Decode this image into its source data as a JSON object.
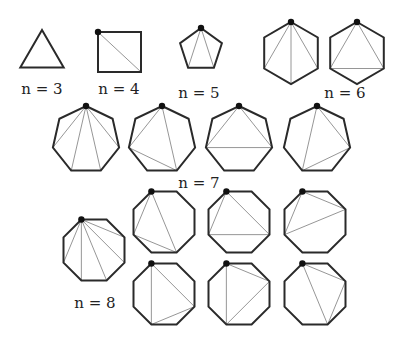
{
  "colors": {
    "edge": "#2a2a2a",
    "diagonal": "#8a8a8a",
    "marker": "#111111",
    "background": "#ffffff"
  },
  "groups": [
    {
      "label": "n = 3",
      "label_pos": [
        42,
        80
      ]
    },
    {
      "label": "n = 4",
      "label_pos": [
        119,
        80
      ]
    },
    {
      "label": "n = 5",
      "label_pos": [
        199,
        84
      ]
    },
    {
      "label": "n = 6",
      "label_pos": [
        345,
        84
      ]
    },
    {
      "label": "n = 7",
      "label_pos": [
        199,
        174
      ]
    },
    {
      "label": "n = 8",
      "label_pos": [
        95,
        294
      ]
    }
  ],
  "polygons": [
    {
      "n": 3,
      "cx": 42,
      "cy": 55,
      "r": 25,
      "rot": -90,
      "marker": false,
      "diagonals": []
    },
    {
      "n": 4,
      "square": [
        98,
        32,
        141,
        72
      ],
      "marker": true,
      "diagonals": [
        [
          0,
          2
        ]
      ]
    },
    {
      "n": 5,
      "cx": 201,
      "cy": 50,
      "r": 22,
      "rot": -90,
      "marker": true,
      "diagonals": [
        [
          0,
          2
        ],
        [
          0,
          3
        ]
      ]
    },
    {
      "n": 6,
      "cx": 291,
      "cy": 53,
      "r": 31,
      "rot": -90,
      "marker": true,
      "diagonals": [
        [
          0,
          2
        ],
        [
          0,
          3
        ],
        [
          0,
          4
        ]
      ]
    },
    {
      "n": 6,
      "cx": 357,
      "cy": 53,
      "r": 31,
      "rot": -90,
      "marker": true,
      "diagonals": [
        [
          0,
          2
        ],
        [
          0,
          4
        ],
        [
          2,
          4
        ]
      ]
    },
    {
      "n": 7,
      "cx": 86,
      "cy": 140,
      "r": 34,
      "rot": -90,
      "marker": true,
      "diagonals": [
        [
          0,
          2
        ],
        [
          0,
          3
        ],
        [
          0,
          4
        ],
        [
          0,
          5
        ]
      ]
    },
    {
      "n": 7,
      "cx": 162,
      "cy": 140,
      "r": 34,
      "rot": -90,
      "marker": true,
      "diagonals": [
        [
          0,
          5
        ],
        [
          0,
          3
        ],
        [
          5,
          3
        ]
      ]
    },
    {
      "n": 7,
      "cx": 239,
      "cy": 140,
      "r": 34,
      "rot": -90,
      "marker": true,
      "diagonals": [
        [
          0,
          5
        ],
        [
          0,
          2
        ],
        [
          5,
          2
        ]
      ]
    },
    {
      "n": 7,
      "cx": 317,
      "cy": 140,
      "r": 34,
      "rot": -90,
      "marker": true,
      "diagonals": [
        [
          0,
          4
        ],
        [
          0,
          2
        ],
        [
          4,
          2
        ]
      ]
    },
    {
      "n": 8,
      "cx": 94,
      "cy": 250,
      "r": 33,
      "rot": -112.5,
      "marker": true,
      "diagonals": [
        [
          0,
          2
        ],
        [
          0,
          3
        ],
        [
          0,
          4
        ],
        [
          0,
          5
        ],
        [
          0,
          6
        ]
      ]
    },
    {
      "n": 8,
      "cx": 164,
      "cy": 222,
      "r": 33,
      "rot": -112.5,
      "marker": true,
      "diagonals": [
        [
          0,
          6
        ],
        [
          0,
          4
        ],
        [
          6,
          4
        ]
      ]
    },
    {
      "n": 8,
      "cx": 239,
      "cy": 222,
      "r": 33,
      "rot": -112.5,
      "marker": true,
      "diagonals": [
        [
          0,
          6
        ],
        [
          0,
          3
        ],
        [
          6,
          3
        ]
      ]
    },
    {
      "n": 8,
      "cx": 315,
      "cy": 222,
      "r": 33,
      "rot": -112.5,
      "marker": true,
      "diagonals": [
        [
          0,
          2
        ],
        [
          0,
          6
        ],
        [
          2,
          6
        ]
      ]
    },
    {
      "n": 8,
      "cx": 164,
      "cy": 294,
      "r": 33,
      "rot": -112.5,
      "marker": true,
      "diagonals": [
        [
          0,
          5
        ],
        [
          0,
          3
        ],
        [
          3,
          5
        ]
      ]
    },
    {
      "n": 8,
      "cx": 239,
      "cy": 294,
      "r": 33,
      "rot": -112.5,
      "marker": true,
      "diagonals": [
        [
          0,
          5
        ],
        [
          0,
          2
        ],
        [
          2,
          5
        ]
      ]
    },
    {
      "n": 8,
      "cx": 315,
      "cy": 294,
      "r": 33,
      "rot": -112.5,
      "marker": true,
      "diagonals": [
        [
          0,
          2
        ],
        [
          0,
          4
        ],
        [
          2,
          4
        ]
      ]
    }
  ]
}
